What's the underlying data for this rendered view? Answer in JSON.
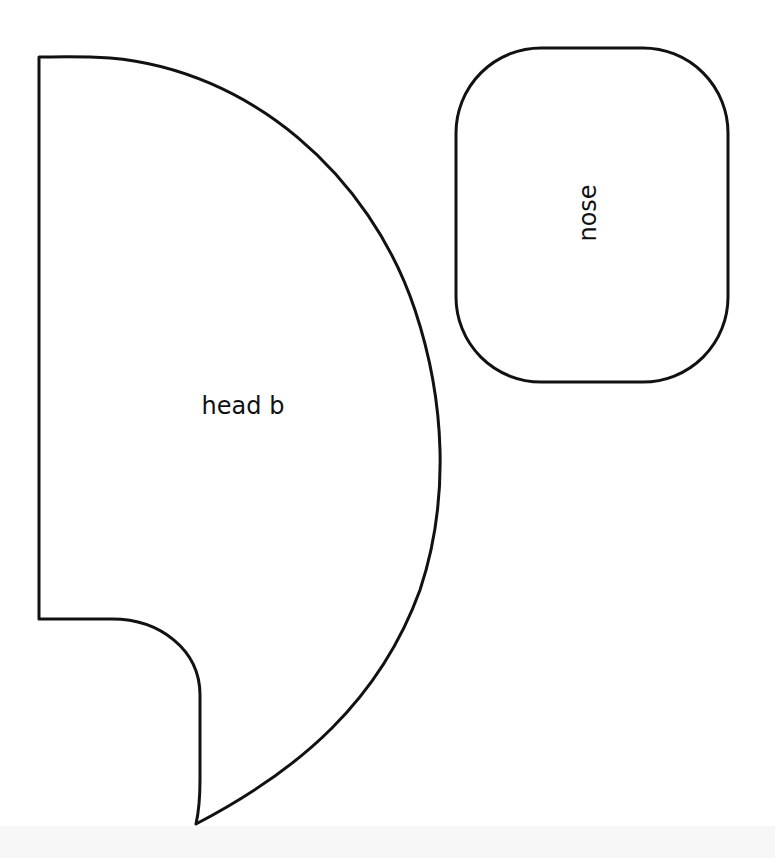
{
  "document": {
    "type": "pattern-template",
    "background_color": "#ffffff",
    "stroke_color": "#111111"
  },
  "pieces": [
    {
      "id": "head-b",
      "label": "head b",
      "shape": "half-circle with notched lower-left corner"
    },
    {
      "id": "nose",
      "label": "nose",
      "label_orientation": "rotated -90deg",
      "shape": "rounded rectangle"
    }
  ]
}
